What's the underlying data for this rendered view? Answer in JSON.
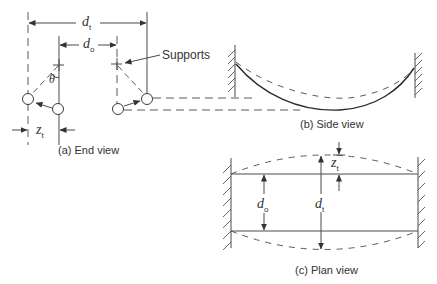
{
  "figure": {
    "panels": [
      {
        "id": "a",
        "caption": "(a) End view"
      },
      {
        "id": "b",
        "caption": "(b) Side view"
      },
      {
        "id": "c",
        "caption": "(c) Plan view"
      }
    ],
    "annotations": {
      "supports": "Supports",
      "theta": "θ"
    },
    "symbols": {
      "d_t": {
        "base": "d",
        "sub": "t"
      },
      "d_o": {
        "base": "d",
        "sub": "o"
      },
      "z_t": {
        "base": "z",
        "sub": "t"
      }
    }
  }
}
